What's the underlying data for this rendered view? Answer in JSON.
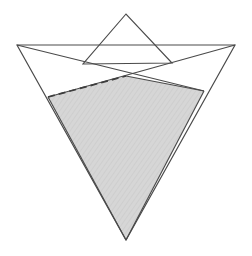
{
  "figure": {
    "canvas": {
      "width": 252,
      "height": 256,
      "background": "#ffffff"
    },
    "colors": {
      "outline": "#4a4a4a",
      "dashed_line": "#3d3d3d",
      "shaded_fill": "#d4d4d4",
      "shaded_fill_texture": "#cbcbcb",
      "background": "#ffffff"
    },
    "points": {
      "upper_triangle_apex": {
        "x": 126,
        "y": 14,
        "label": "top apex"
      },
      "upper_triangle_base_left": {
        "x": 83,
        "y": 64,
        "label": "upper triangle base left"
      },
      "upper_triangle_base_right": {
        "x": 172,
        "y": 63,
        "label": "upper triangle base right"
      },
      "lower_triangle_left_tip": {
        "x": 17,
        "y": 45,
        "label": "left wing tip"
      },
      "lower_triangle_right_tip": {
        "x": 235,
        "y": 45,
        "label": "right wing tip"
      },
      "lower_triangle_apex": {
        "x": 126,
        "y": 240,
        "label": "bottom apex"
      },
      "crossing_center": {
        "x": 126,
        "y": 76,
        "label": "center crossing point"
      },
      "shaded_corner_left": {
        "x": 48,
        "y": 97,
        "label": "shaded region left corner"
      },
      "shaded_corner_right": {
        "x": 204,
        "y": 91,
        "label": "shaded region right corner"
      }
    },
    "shapes": [
      {
        "name": "shaded-intersection-region",
        "type": "polygon",
        "fill": "#d4d4d4",
        "vertices": [
          [
            48,
            97
          ],
          [
            126,
            76
          ],
          [
            204,
            91
          ],
          [
            126,
            240
          ]
        ]
      },
      {
        "name": "upper-triangle",
        "type": "polygon",
        "fill": "none",
        "vertices": [
          [
            126,
            14
          ],
          [
            83,
            64
          ],
          [
            172,
            63
          ]
        ]
      },
      {
        "name": "lower-triangle",
        "type": "polygon",
        "fill": "none",
        "vertices": [
          [
            17,
            45
          ],
          [
            235,
            45
          ],
          [
            126,
            240
          ]
        ]
      },
      {
        "name": "left-chord-line",
        "type": "line",
        "from": [
          17,
          45
        ],
        "to": [
          204,
          91
        ]
      },
      {
        "name": "right-chord-line",
        "type": "line",
        "from": [
          235,
          45
        ],
        "to": [
          48,
          97
        ]
      },
      {
        "name": "dashed-segment",
        "type": "dashed-line",
        "from": [
          48,
          97
        ],
        "to": [
          126,
          76
        ],
        "dash_pattern": "7 4"
      }
    ]
  }
}
